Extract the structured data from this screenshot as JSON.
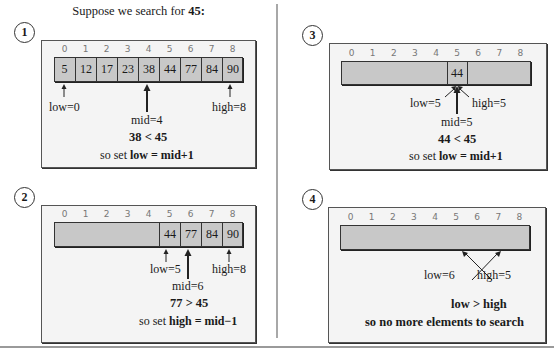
{
  "title": {
    "prefix": "Suppose we search for ",
    "target": "45:"
  },
  "indices": [
    "0",
    "1",
    "2",
    "3",
    "4",
    "5",
    "6",
    "7",
    "8"
  ],
  "panels": [
    {
      "step": "1",
      "array": [
        "5",
        "12",
        "17",
        "23",
        "38",
        "44",
        "77",
        "84",
        "90"
      ],
      "visible": [
        0,
        1,
        2,
        3,
        4,
        5,
        6,
        7,
        8
      ],
      "labels": {
        "low": "low=0",
        "mid": "mid=4",
        "high": "high=8"
      },
      "comparison": "38 < 45",
      "note_prefix": "so set ",
      "note_bold": "low = mid+1"
    },
    {
      "step": "2",
      "array": [
        "",
        "",
        "",
        "",
        "",
        "44",
        "77",
        "84",
        "90"
      ],
      "visible": [
        5,
        6,
        7,
        8
      ],
      "labels": {
        "low": "low=5",
        "mid": "mid=6",
        "high": "high=8"
      },
      "comparison": "77 > 45",
      "note_prefix": "so set ",
      "note_bold": "high = mid−1"
    },
    {
      "step": "3",
      "array": [
        "",
        "",
        "",
        "",
        "",
        "44",
        "",
        "",
        ""
      ],
      "visible": [
        5
      ],
      "labels": {
        "low": "low=5",
        "mid": "mid=5",
        "high": "high=5"
      },
      "comparison": "44 < 45",
      "note_prefix": "so set ",
      "note_bold": "low = mid+1"
    },
    {
      "step": "4",
      "array": [
        "",
        "",
        "",
        "",
        "",
        "",
        "",
        "",
        ""
      ],
      "visible": [],
      "labels": {
        "low": "low=6",
        "high": "high=5"
      },
      "comparison": "low > high",
      "note_bold": "so no more elements to search"
    }
  ]
}
